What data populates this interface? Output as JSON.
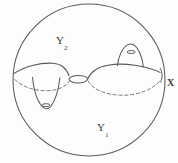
{
  "figure": {
    "kind": "topology-sphere-decomposition",
    "labels": {
      "outer_space": {
        "base": "X",
        "sub": ""
      },
      "upper_region": {
        "base": "Y",
        "sub": "2"
      },
      "lower_region": {
        "base": "Y",
        "sub": "1"
      }
    },
    "features": [
      "outer-circle-boundary",
      "horizon-curve",
      "pinch-neck-lens",
      "left-downward-funnel",
      "right-upward-dome",
      "dashed-hidden-back-edges"
    ],
    "colors": {
      "background": "#fdfdfd",
      "stroke": "#5a5a5a",
      "stroke_light": "#7a7a7a",
      "label": "#3a3a3a"
    },
    "geometry": {
      "circle": {
        "cx": 89,
        "cy": 80,
        "r": 76
      },
      "neck": {
        "cx": 78,
        "cy": 79,
        "rx": 10,
        "ry": 5
      },
      "left_dip_mark": {
        "cx": 46,
        "cy": 105,
        "rx": 4,
        "ry": 1.6
      },
      "right_dome_mark": {
        "cx": 131,
        "cy": 52,
        "rx": 4,
        "ry": 1.6
      }
    }
  }
}
